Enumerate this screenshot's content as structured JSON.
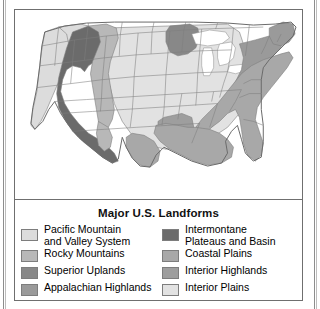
{
  "figure": {
    "title": "Major U.S. Landforms"
  },
  "legend": {
    "left_column": [
      {
        "label": "Pacific Mountain\nand Valley System",
        "color": "#dcdcdc",
        "two_line": true
      },
      {
        "label": "Rocky Mountains",
        "color": "#b8b8b8",
        "two_line": false
      },
      {
        "label": "Superior Uplands",
        "color": "#888888",
        "two_line": false
      },
      {
        "label": "Appalachian Highlands",
        "color": "#9a9a9a",
        "two_line": false
      }
    ],
    "right_column": [
      {
        "label": "Intermontane\nPlateaus and Basin",
        "color": "#6b6b6b",
        "two_line": true
      },
      {
        "label": "Coastal Plains",
        "color": "#a8a8a8",
        "two_line": false
      },
      {
        "label": "Interior Highlands",
        "color": "#9e9e9e",
        "two_line": false
      },
      {
        "label": "Interior Plains",
        "color": "#e2e2e2",
        "two_line": false
      }
    ]
  },
  "map": {
    "regions": [
      {
        "name": "pacific-mountain-and-valley-system",
        "color": "#dcdcdc"
      },
      {
        "name": "intermontane-plateaus-and-basin",
        "color": "#6b6b6b"
      },
      {
        "name": "rocky-mountains",
        "color": "#b8b8b8"
      },
      {
        "name": "interior-plains",
        "color": "#e2e2e2"
      },
      {
        "name": "superior-uplands",
        "color": "#888888"
      },
      {
        "name": "interior-highlands",
        "color": "#9e9e9e"
      },
      {
        "name": "appalachian-highlands",
        "color": "#9a9a9a"
      },
      {
        "name": "coastal-plains",
        "color": "#a8a8a8"
      },
      {
        "name": "great-lakes",
        "color": "#ffffff"
      }
    ],
    "outline_color": "#6a6a6a",
    "state_border_color": "#7e7e7e"
  }
}
